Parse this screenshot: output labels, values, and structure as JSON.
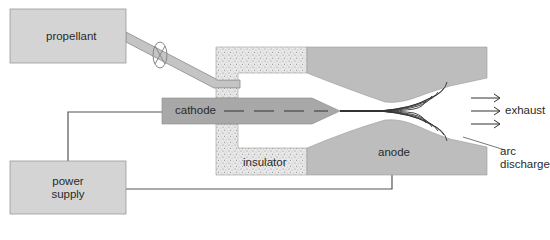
{
  "diagram": {
    "type": "arcjet thruster schematic",
    "labels": {
      "propellant": "propellant",
      "power_supply_line1": "power",
      "power_supply_line2": "supply",
      "cathode": "cathode",
      "insulator": "insulator",
      "anode": "anode",
      "exhaust": "exhaust",
      "arc_line1": "arc",
      "arc_line2": "discharge"
    },
    "colors": {
      "box_fill": "#d4d4d4",
      "box_stroke": "#9a9a9a",
      "anode_fill": "#b9b9b9",
      "cathode_fill": "#a6a6a6",
      "insulator_fill": "#e6e6e6",
      "insulator_speckle": "#7a7a7a",
      "line": "#555555",
      "arc": "#3a3a3a"
    }
  }
}
